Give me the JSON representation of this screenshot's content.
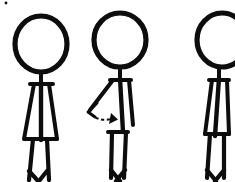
{
  "scene": {
    "title": "Three stick figures exercise sequence",
    "description": "Hand-drawn black-and-white line drawing of three stick figures standing in a row; the middle figure swings one arm forward with a curved dashed motion arrow",
    "background_color": "#ffffff",
    "ink_color": "#0d0d0d",
    "width": 235,
    "height": 182,
    "figure_count": "3"
  },
  "figures": [
    {
      "id": "figure-1",
      "label": "Stick figure 1 - standing upright",
      "pose": "standing, arms down at sides",
      "head": {
        "cx": 41,
        "cy": 44,
        "rx": 26,
        "ry": 28
      },
      "neck": {
        "x1": 41,
        "y1": 72,
        "x2": 41,
        "y2": 82
      },
      "spine": {
        "x1": 41,
        "y1": 82,
        "x2": 41,
        "y2": 140
      },
      "arm_left": {
        "x1": 34,
        "y1": 84,
        "x2": 24,
        "y2": 139
      },
      "arm_right": {
        "x1": 49,
        "y1": 84,
        "x2": 57,
        "y2": 139
      },
      "shoulder": {
        "x1": 30,
        "y1": 84,
        "x2": 53,
        "y2": 84
      },
      "hip": {
        "x1": 25,
        "y1": 139,
        "x2": 57,
        "y2": 139
      },
      "leg_left": {
        "x1": 33,
        "y1": 139,
        "x2": 29,
        "y2": 180
      },
      "leg_right": {
        "x1": 47,
        "y1": 139,
        "x2": 49,
        "y2": 180
      },
      "foot_left": {
        "x1": 29,
        "y1": 171,
        "x2": 38,
        "y2": 181
      },
      "foot_right": {
        "x1": 47,
        "y1": 171,
        "x2": 39,
        "y2": 181
      }
    },
    {
      "id": "figure-2",
      "label": "Stick figure 2 - arm swing with motion arrow",
      "pose": "standing, one arm swung forward, motion arrow at hand",
      "head": {
        "cx": 120,
        "cy": 40,
        "rx": 26,
        "ry": 27
      },
      "neck": {
        "x1": 120,
        "y1": 67,
        "x2": 120,
        "y2": 78
      },
      "spine": {
        "x1": 120,
        "y1": 78,
        "x2": 123,
        "y2": 132
      },
      "arm_left": {
        "x1": 113,
        "y1": 80,
        "x2": 90,
        "y2": 110
      },
      "arm_right": {
        "x1": 129,
        "y1": 80,
        "x2": 133,
        "y2": 125
      },
      "shoulder": {
        "x1": 110,
        "y1": 80,
        "x2": 131,
        "y2": 80
      },
      "hip": {
        "x1": 108,
        "y1": 132,
        "x2": 128,
        "y2": 132
      },
      "leg_left": {
        "x1": 112,
        "y1": 132,
        "x2": 111,
        "y2": 178
      },
      "leg_right": {
        "x1": 126,
        "y1": 132,
        "x2": 124,
        "y2": 178
      },
      "foot_left": {
        "x1": 111,
        "y1": 170,
        "x2": 120,
        "y2": 181
      },
      "foot_right": {
        "x1": 125,
        "y1": 170,
        "x2": 116,
        "y2": 181
      }
    },
    {
      "id": "figure-3",
      "label": "Stick figure 3 - standing upright, cropped at right edge",
      "pose": "standing, arms down at sides",
      "head": {
        "cx": 222,
        "cy": 40,
        "rx": 25,
        "ry": 27
      },
      "neck": {
        "x1": 219,
        "y1": 67,
        "x2": 219,
        "y2": 78
      },
      "spine": {
        "x1": 219,
        "y1": 78,
        "x2": 215,
        "y2": 136
      },
      "arm_left": {
        "x1": 212,
        "y1": 80,
        "x2": 205,
        "y2": 134
      },
      "arm_right": {
        "x1": 227,
        "y1": 80,
        "x2": 229,
        "y2": 134
      },
      "shoulder": {
        "x1": 209,
        "y1": 80,
        "x2": 229,
        "y2": 80
      },
      "hip": {
        "x1": 205,
        "y1": 134,
        "x2": 229,
        "y2": 134
      },
      "leg_left": {
        "x1": 210,
        "y1": 134,
        "x2": 207,
        "y2": 178
      },
      "leg_right": {
        "x1": 224,
        "y1": 134,
        "x2": 224,
        "y2": 178
      },
      "foot_left": {
        "x1": 207,
        "y1": 170,
        "x2": 216,
        "y2": 181
      },
      "foot_right": {
        "x1": 224,
        "y1": 170,
        "x2": 215,
        "y2": 181
      }
    }
  ],
  "annotations": {
    "motion_arrow": {
      "label": "curved dashed motion arrow showing arm swing direction",
      "direction": "leftward hand swinging down and to the right",
      "dash_path": "M 91 114 Q 99 122 111 119",
      "tail_path": "M 97 103 L 88 112 L 95 117",
      "head_points": "111,113 118,119.5 109,124",
      "color": "#0d0d0d"
    },
    "speck": {
      "label": "small ink speck artifact at top left",
      "cx": 6,
      "cy": 3,
      "r": 1.4
    }
  }
}
